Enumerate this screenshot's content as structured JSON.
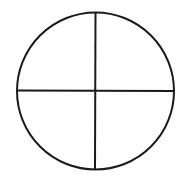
{
  "diagram": {
    "type": "circle-divided-into-quadrants",
    "circle": {
      "cx": 95.5,
      "cy": 91,
      "r": 78.5,
      "stroke": "#1a1a1a",
      "stroke_width": 2
    },
    "vertical_line": {
      "x1": 95.5,
      "y1": 13,
      "x2": 95,
      "y2": 169
    },
    "horizontal_line": {
      "x1": 17,
      "y1": 90.5,
      "x2": 173,
      "y2": 91
    },
    "background": "#ffffff"
  }
}
